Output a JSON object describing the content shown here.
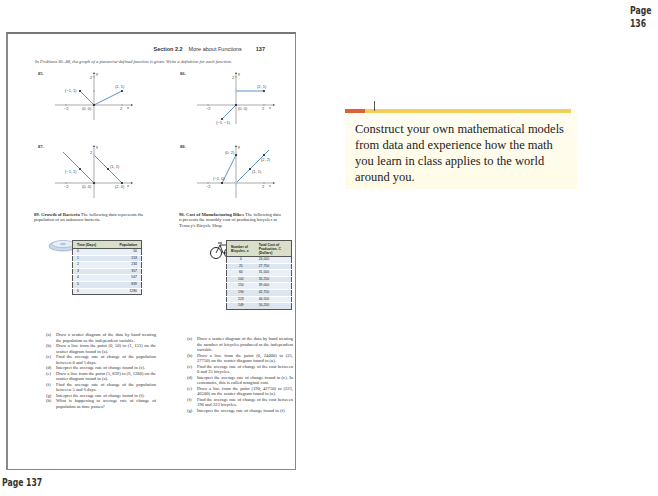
{
  "labels": {
    "page_136": "Page 136",
    "page_137": "Page 137"
  },
  "header": {
    "section": "Section 2.2",
    "title": "More about Functions",
    "page_number": "137"
  },
  "intro": "In Problems 85–88, the graph of a piecewise-defined function is given. Write a definition for each function.",
  "graphs": [
    {
      "number": "85.",
      "points": [
        "(−1, 1)",
        "(0, 0)",
        "(2, 1)"
      ],
      "x_ticks": [
        "−2",
        "2"
      ],
      "y_tick": "2",
      "axes": [
        "y",
        "x"
      ]
    },
    {
      "number": "86.",
      "points": [
        "(2, 1)",
        "(0, 0)",
        "(−1, −1)"
      ],
      "x_ticks": [
        "−2",
        "2"
      ],
      "y_tick": "2",
      "axes": [
        "y",
        "x"
      ]
    },
    {
      "number": "87.",
      "points": [
        "(−1, 1)",
        "(0, 0)",
        "(1, 1)",
        "(2, 0)"
      ],
      "x_ticks": [
        "−2",
        "2"
      ],
      "y_tick": "2",
      "axes": [
        "y",
        "x"
      ]
    },
    {
      "number": "88.",
      "points": [
        "(0, 2)",
        "(−1, 0)",
        "(1, 1)",
        "(2, 2)"
      ],
      "x_ticks": [
        "−2",
        "2"
      ],
      "y_tick": "2",
      "axes": [
        "y",
        "x"
      ]
    }
  ],
  "problem89": {
    "number": "89.",
    "title": "Growth of Bacteria",
    "text": "The following data represents the population of an unknown bacteria.",
    "table": {
      "headers": [
        "Time (Days)",
        "Population"
      ],
      "rows": [
        [
          "0",
          "50"
        ],
        [
          "1",
          "153"
        ],
        [
          "2",
          "234"
        ],
        [
          "3",
          "357"
        ],
        [
          "4",
          "547"
        ],
        [
          "5",
          "839"
        ],
        [
          "6",
          "1280"
        ]
      ]
    },
    "questions": [
      {
        "label": "(a)",
        "text": "Draw a scatter diagram of the data by hand treating the population as the independent variable."
      },
      {
        "label": "(b)",
        "text": "Draw a line from the point (0, 50) to (1, 153) on the scatter diagram found in (a)."
      },
      {
        "label": "(c)",
        "text": "Find the average rate of change of the population between 0 and 1 days."
      },
      {
        "label": "(d)",
        "text": "Interpret the average rate of change found in (c)."
      },
      {
        "label": "(e)",
        "text": "Draw a line from the point (5, 839) to (6, 1280) on the scatter diagram found in (a)."
      },
      {
        "label": "(f)",
        "text": "Find the average rate of change of the population between 5 and 6 days."
      },
      {
        "label": "(g)",
        "text": "Interpret the average rate of change found in (f)."
      },
      {
        "label": "(h)",
        "text": "What is happening to average rate of change of population as time passes?"
      }
    ]
  },
  "problem90": {
    "number": "90.",
    "title": "Cost of Manufacturing Bikes",
    "text": "The following data represents the monthly cost of producing bicycles at Tenney's Bicycle Shop.",
    "table": {
      "headers": [
        "Number of Bicycles, x",
        "Total Cost of Production, C (Dollars)"
      ],
      "rows": [
        [
          "0",
          "24,000"
        ],
        [
          "25",
          "27,750"
        ],
        [
          "60",
          "31,500"
        ],
        [
          "102",
          "35,250"
        ],
        [
          "150",
          "39,000"
        ],
        [
          "190",
          "42,750"
        ],
        [
          "223",
          "46,500"
        ],
        [
          "249",
          "50,250"
        ]
      ]
    },
    "questions": [
      {
        "label": "(a)",
        "text": "Draw a scatter diagram of the data by hand treating the number of bicycles produced as the independent variable."
      },
      {
        "label": "(b)",
        "text": "Draw a line from the point (0, 24000) to (25, 27750) on the scatter diagram found in (a)."
      },
      {
        "label": "(c)",
        "text": "Find the average rate of change of the cost between 0 and 25 bicycles."
      },
      {
        "label": "(d)",
        "text": "Interpret the average rate of change found in (c). In economics, this is called marginal cost."
      },
      {
        "label": "(e)",
        "text": "Draw a line from the point (190, 42750) to (223, 46500) on the scatter diagram found in (a)."
      },
      {
        "label": "(f)",
        "text": "Find the average rate of change of the cost between 190 and 223 bicycles."
      },
      {
        "label": "(g)",
        "text": "Interpret the average rate of change found in (f)."
      }
    ]
  },
  "callout": {
    "text": "Construct your own mathematical models from data and experience how the math you learn in class applies to the world around you.",
    "colors": {
      "bar": "#f4cf57",
      "accent": "#e0603a",
      "background": "#fffbe6"
    }
  },
  "colors": {
    "graph_line": "#4a86c5",
    "table_header": "#d9dfc8",
    "table_body": "#e8eff6"
  }
}
